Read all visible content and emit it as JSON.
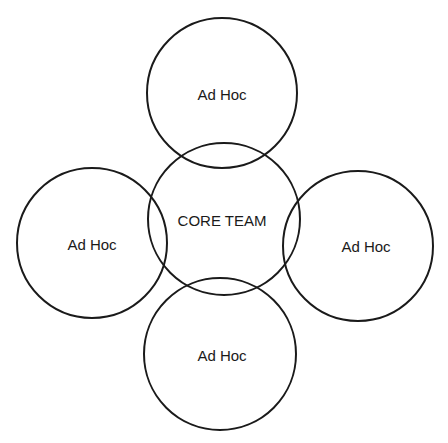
{
  "diagram": {
    "type": "overlapping-circles",
    "stroke_color": "#1a1a1a",
    "background": "#ffffff",
    "nodes": [
      {
        "id": "core",
        "label": "CORE TEAM",
        "cx": 224,
        "cy": 219,
        "r": 76
      },
      {
        "id": "top",
        "label": "Ad Hoc",
        "cx": 222,
        "cy": 93,
        "r": 75
      },
      {
        "id": "left",
        "label": "Ad Hoc",
        "cx": 92,
        "cy": 243,
        "r": 75
      },
      {
        "id": "right",
        "label": "Ad Hoc",
        "cx": 358,
        "cy": 246,
        "r": 75
      },
      {
        "id": "bottom",
        "label": "Ad Hoc",
        "cx": 220,
        "cy": 354,
        "r": 76
      }
    ],
    "labels": {
      "core": "CORE TEAM",
      "top": "Ad Hoc",
      "left": "Ad Hoc",
      "right": "Ad Hoc",
      "bottom": "Ad Hoc"
    }
  }
}
